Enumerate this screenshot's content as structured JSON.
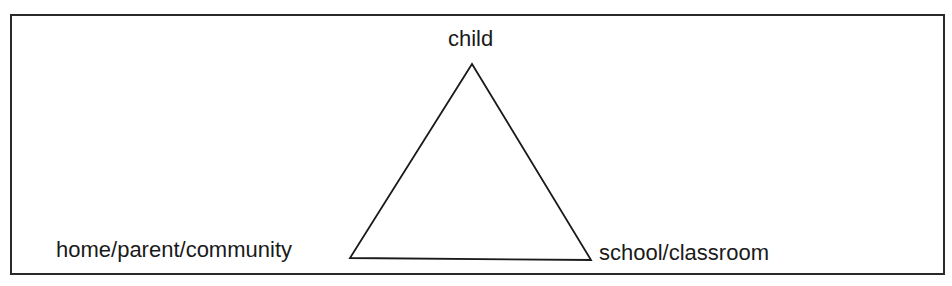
{
  "diagram": {
    "type": "triangle",
    "nodes": [
      {
        "id": "child",
        "label": "child",
        "position": "top"
      },
      {
        "id": "home",
        "label": "home/parent/community",
        "position": "bottom-left"
      },
      {
        "id": "school",
        "label": "school/classroom",
        "position": "bottom-right"
      }
    ],
    "edges": [
      {
        "from": "child",
        "to": "home"
      },
      {
        "from": "child",
        "to": "school"
      },
      {
        "from": "home",
        "to": "school"
      }
    ],
    "colors": {
      "stroke": "#1a1a1a",
      "background": "#ffffff"
    }
  }
}
